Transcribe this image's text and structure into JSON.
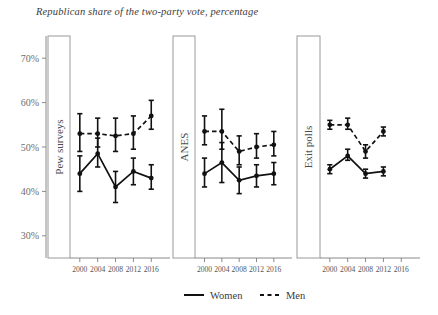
{
  "chart_data": {
    "type": "line",
    "title": "Republican share of the two-party vote, percentage",
    "xlabel": "",
    "ylabel": "",
    "ylim": [
      25,
      75
    ],
    "yticks": [
      30,
      40,
      50,
      60,
      70
    ],
    "ytick_labels": [
      "30%",
      "40%",
      "50%",
      "60%",
      "70%"
    ],
    "grid": false,
    "legend": {
      "position": "bottom",
      "entries": [
        {
          "name": "Women",
          "style": "solid"
        },
        {
          "name": "Men",
          "style": "dashed"
        }
      ]
    },
    "panels": [
      {
        "label": "Pew surveys",
        "categories": [
          "2000",
          "2004",
          "2008",
          "2012",
          "2016"
        ],
        "x": [
          2000,
          2004,
          2008,
          2012,
          2016
        ],
        "series": [
          {
            "name": "Women",
            "style": "solid",
            "values": [
              44.0,
              48.5,
              41.0,
              44.5,
              43.0
            ],
            "err_low": [
              40.0,
              45.5,
              37.5,
              41.5,
              40.5
            ],
            "err_high": [
              48.0,
              52.0,
              44.5,
              47.5,
              46.0
            ]
          },
          {
            "name": "Men",
            "style": "dashed",
            "values": [
              53.0,
              53.0,
              52.5,
              53.0,
              57.0
            ],
            "err_low": [
              49.0,
              50.0,
              49.0,
              49.5,
              54.0
            ],
            "err_high": [
              57.5,
              56.5,
              56.5,
              57.0,
              60.5
            ]
          }
        ]
      },
      {
        "label": "ANES",
        "categories": [
          "2000",
          "2004",
          "2008",
          "2012",
          "2016"
        ],
        "x": [
          2000,
          2004,
          2008,
          2012,
          2016
        ],
        "series": [
          {
            "name": "Women",
            "style": "solid",
            "values": [
              44.0,
              46.5,
              42.5,
              43.5,
              44.0
            ],
            "err_low": [
              41.0,
              42.0,
              39.5,
              41.0,
              41.5
            ],
            "err_high": [
              47.5,
              51.0,
              45.5,
              46.0,
              46.5
            ]
          },
          {
            "name": "Men",
            "style": "dashed",
            "values": [
              53.5,
              53.5,
              49.0,
              50.0,
              50.5
            ],
            "err_low": [
              50.5,
              49.5,
              46.0,
              47.5,
              48.0
            ],
            "err_high": [
              57.0,
              58.5,
              52.5,
              53.0,
              53.5
            ]
          }
        ]
      },
      {
        "label": "Exit polls",
        "categories": [
          "2000",
          "2004",
          "2008",
          "2012",
          "2016"
        ],
        "x": [
          2000,
          2004,
          2008,
          2012
        ],
        "series": [
          {
            "name": "Women",
            "style": "solid",
            "values": [
              45.0,
              48.0,
              44.0,
              44.5
            ],
            "err_low": [
              44.0,
              47.0,
              43.0,
              43.5
            ],
            "err_high": [
              46.0,
              49.5,
              45.0,
              45.5
            ]
          },
          {
            "name": "Men",
            "style": "dashed",
            "values": [
              55.0,
              55.0,
              49.0,
              53.5
            ],
            "err_low": [
              54.0,
              54.0,
              47.5,
              52.5
            ],
            "err_high": [
              56.0,
              56.5,
              50.5,
              54.5
            ]
          }
        ]
      }
    ]
  }
}
